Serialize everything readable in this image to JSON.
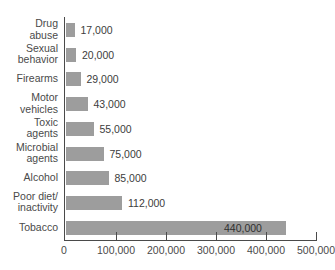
{
  "chart_data": {
    "type": "bar",
    "orientation": "horizontal",
    "title": "",
    "subtitle": "",
    "xlabel": "",
    "ylabel": "",
    "xlim": [
      0,
      500000
    ],
    "grid": false,
    "legend": null,
    "categories": [
      "Drug\nabuse",
      "Sexual\nbehavior",
      "Firearms",
      "Motor\nvehicles",
      "Toxic\nagents",
      "Microbial\nagents",
      "Alcohol",
      "Poor diet/\ninactivity",
      "Tobacco"
    ],
    "values": [
      17000,
      20000,
      29000,
      43000,
      55000,
      75000,
      85000,
      112000,
      440000
    ],
    "value_labels": [
      "17,000",
      "20,000",
      "29,000",
      "43,000",
      "55,000",
      "75,000",
      "85,000",
      "112,000",
      "440,000"
    ],
    "xticks": [
      0,
      100000,
      200000,
      300000,
      400000,
      500000
    ],
    "xtick_labels": [
      "0",
      "100,000",
      "200,000",
      "300,000",
      "400,000",
      "500,000"
    ],
    "colors": {
      "bar_fill": "#9d9d9d",
      "axis": "#4a4a4a",
      "text": "#3c3c3c",
      "background": "#ffffff"
    }
  }
}
